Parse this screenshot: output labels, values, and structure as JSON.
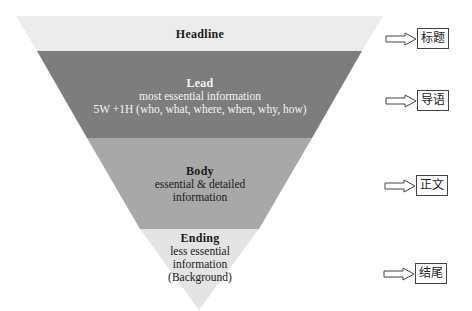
{
  "colors": {
    "headline": "#ececec",
    "lead": "#7d7d7d",
    "body": "#a8a8a8",
    "ending": "#e4e4e4",
    "light_text": "#f4f4f4",
    "dark_text": "#1a1a1a"
  },
  "sections": [
    {
      "title": "Headline",
      "lines": [],
      "zh_label": "标题"
    },
    {
      "title": "Lead",
      "lines": [
        "most essential information",
        "5W +1H (who, what, where, when, why, how)"
      ],
      "zh_label": "导语"
    },
    {
      "title": "Body",
      "lines": [
        "essential & detailed",
        "information"
      ],
      "zh_label": "正文"
    },
    {
      "title": "Ending",
      "lines": [
        "less essential",
        "information",
        "(Background)"
      ],
      "zh_label": "结尾"
    }
  ]
}
